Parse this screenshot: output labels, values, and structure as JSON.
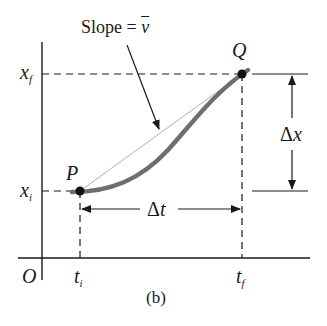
{
  "figure": {
    "caption": "(b)",
    "slope_label": {
      "prefix": "Slope = ",
      "symbol": "v"
    },
    "points": {
      "P": {
        "label": "P"
      },
      "Q": {
        "label": "Q"
      }
    },
    "axes": {
      "origin": "O",
      "x_ticks": [
        {
          "base": "t",
          "sub": "i"
        },
        {
          "base": "t",
          "sub": "f"
        }
      ],
      "y_ticks": [
        {
          "base": "x",
          "sub": "f"
        },
        {
          "base": "x",
          "sub": "i"
        }
      ]
    },
    "intervals": {
      "delta_t": {
        "delta": "Δ",
        "var": "t"
      },
      "delta_x": {
        "delta": "Δ",
        "var": "x"
      }
    }
  },
  "colors": {
    "line": "#1a1a1a",
    "curve": "#6e6e6e",
    "chord": "#b0b0b0",
    "background": "#ffffff"
  }
}
